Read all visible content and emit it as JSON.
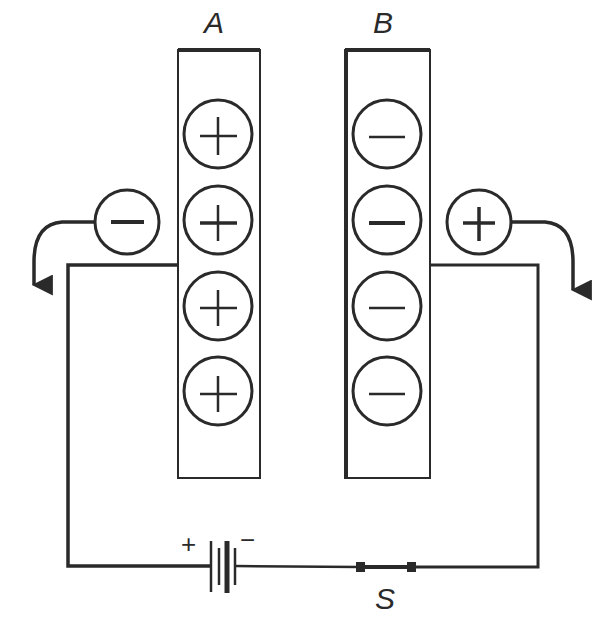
{
  "diagram": {
    "colors": {
      "ink": "#2a2a2a",
      "background": "#ffffff"
    },
    "plates": [
      {
        "label": "A",
        "charge_sign": "+",
        "charges": [
          "+",
          "+",
          "+",
          "+"
        ]
      },
      {
        "label": "B",
        "charge_sign": "−",
        "charges": [
          "−",
          "−",
          "−",
          "−"
        ]
      }
    ],
    "free_charges": [
      {
        "sign": "−",
        "side": "left",
        "direction": "leaving plate A"
      },
      {
        "sign": "+",
        "side": "right",
        "direction": "leaving plate B"
      }
    ],
    "battery": {
      "positive_label": "+",
      "negative_label": "−"
    },
    "switch": {
      "label": "S",
      "state": "closed"
    }
  }
}
